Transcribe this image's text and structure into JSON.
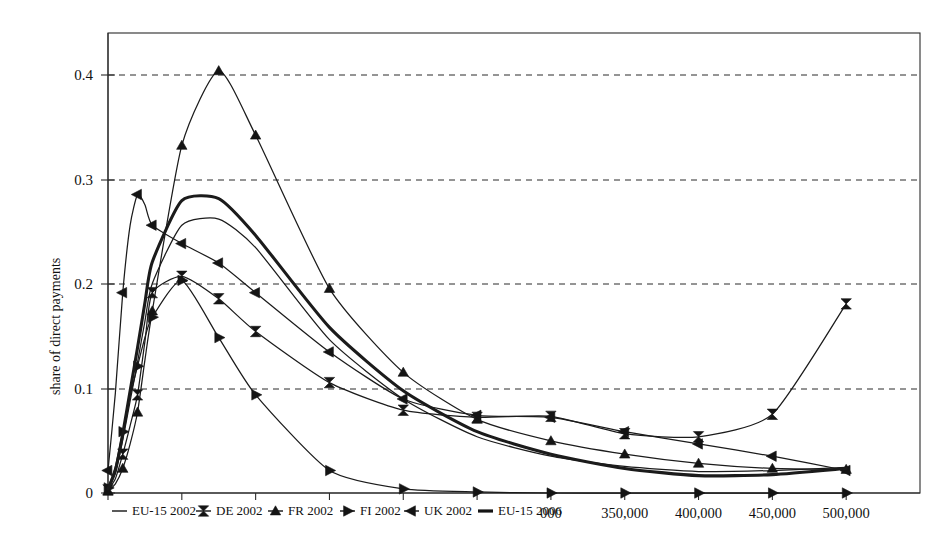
{
  "chart_data": {
    "type": "line",
    "title": "",
    "subtitle": "",
    "xlabel": "",
    "ylabel": "share of direct payments",
    "xlim": [
      0,
      550000
    ],
    "ylim": [
      0,
      0.45
    ],
    "grid": "horizontal-dashed",
    "legend_position": "bottom-left-inline",
    "ytick_labels": [
      "0",
      "0.1",
      "0.2",
      "0.3",
      "0.4"
    ],
    "ytick_values": [
      0,
      0.1,
      0.2,
      0.3,
      0.4
    ],
    "xtick_values": [
      0,
      50000,
      100000,
      150000,
      200000,
      250000,
      300000,
      350000,
      400000,
      450000,
      500000
    ],
    "xtick_labels": [
      "",
      "",
      "",
      "",
      "",
      "",
      "000",
      "350,000",
      "400,000",
      "450,000",
      "500,000"
    ],
    "xtick_labels_note": "left-hand x tick labels are covered by the overlapping legend row",
    "x": [
      0,
      5000,
      10000,
      15000,
      20000,
      25000,
      30000,
      50000,
      75000,
      100000,
      150000,
      200000,
      250000,
      300000,
      350000,
      400000,
      450000,
      500000
    ],
    "series": [
      {
        "name": "EU-15 2002",
        "marker": "none",
        "line_width": "thin",
        "values": [
          0.004,
          0.02,
          0.052,
          0.09,
          0.128,
          0.168,
          0.205,
          0.262,
          0.268,
          0.24,
          0.15,
          0.092,
          0.055,
          0.036,
          0.026,
          0.021,
          0.022,
          0.025
        ]
      },
      {
        "name": "DE 2002",
        "marker": "bowtie",
        "line_width": "thin",
        "values": [
          0.003,
          0.014,
          0.038,
          0.066,
          0.096,
          0.148,
          0.196,
          0.212,
          0.19,
          0.158,
          0.108,
          0.081,
          0.074,
          0.075,
          0.058,
          0.055,
          0.077,
          0.185
        ]
      },
      {
        "name": "FR 2002",
        "marker": "triangle-up",
        "line_width": "thin",
        "values": [
          0.002,
          0.009,
          0.024,
          0.048,
          0.079,
          0.13,
          0.178,
          0.34,
          0.413,
          0.35,
          0.2,
          0.118,
          0.072,
          0.051,
          0.038,
          0.029,
          0.024,
          0.023
        ]
      },
      {
        "name": "FI 2002",
        "marker": "triangle-right",
        "line_width": "thin",
        "values": [
          0.005,
          0.026,
          0.06,
          0.095,
          0.124,
          0.152,
          0.172,
          0.208,
          0.152,
          0.096,
          0.022,
          0.004,
          0.001,
          0.0,
          0.0,
          0.0,
          0.0,
          0.0
        ]
      },
      {
        "name": "UK 2002",
        "marker": "triangle-left",
        "line_width": "thin",
        "values": [
          0.022,
          0.098,
          0.196,
          0.262,
          0.292,
          0.282,
          0.262,
          0.244,
          0.225,
          0.196,
          0.138,
          0.092,
          0.076,
          0.074,
          0.06,
          0.048,
          0.036,
          0.022
        ]
      },
      {
        "name": "EU-15 2006",
        "marker": "none",
        "line_width": "thick",
        "values": [
          0.004,
          0.022,
          0.058,
          0.1,
          0.142,
          0.186,
          0.226,
          0.286,
          0.288,
          0.252,
          0.162,
          0.1,
          0.06,
          0.038,
          0.024,
          0.017,
          0.018,
          0.024
        ]
      }
    ]
  },
  "axes": {
    "ylabel": "share of direct payments",
    "ytick_labels": [
      "0",
      "0.1",
      "0.2",
      "0.3",
      "0.4"
    ],
    "xtick_labels_visible": [
      "000",
      "350,000",
      "400,000",
      "450,000",
      "500,000"
    ]
  },
  "legend": {
    "entries": [
      {
        "label": "EU-15 2002",
        "marker": "line"
      },
      {
        "label": "DE 2002",
        "marker": "bowtie"
      },
      {
        "label": "FR 2002",
        "marker": "triangle-up"
      },
      {
        "label": "FI 2002",
        "marker": "triangle-right"
      },
      {
        "label": "UK 2002",
        "marker": "triangle-left"
      },
      {
        "label": "EU-15 2006",
        "marker": "thick-line"
      }
    ]
  },
  "colors": {
    "ink": "#1a1a1a",
    "grid": "#2b2b2b",
    "background": "#ffffff"
  }
}
